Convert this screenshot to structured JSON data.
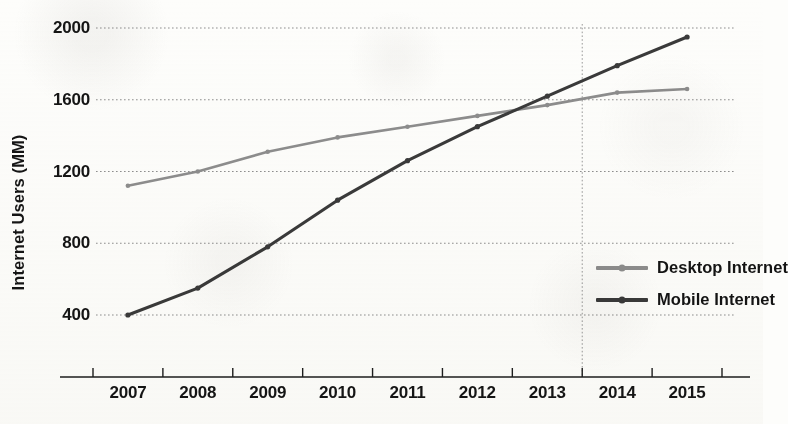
{
  "chart_data": {
    "type": "line",
    "title": "",
    "xlabel": "",
    "ylabel": "Internet Users (MM)",
    "categories": [
      "2007",
      "2008",
      "2009",
      "2010",
      "2011",
      "2012",
      "2013",
      "2014",
      "2015"
    ],
    "x": [
      2007,
      2008,
      2009,
      2010,
      2011,
      2012,
      2013,
      2014,
      2015
    ],
    "series": [
      {
        "name": "Desktop Internet",
        "color": "#8d8d8d",
        "values": [
          1120,
          1200,
          1310,
          1390,
          1450,
          1510,
          1570,
          1640,
          1660
        ]
      },
      {
        "name": "Mobile Internet",
        "color": "#3a3a3a",
        "values": [
          400,
          550,
          780,
          1040,
          1260,
          1450,
          1620,
          1790,
          1950
        ]
      }
    ],
    "ylim": [
      200,
      2100
    ],
    "yticks": [
      400,
      800,
      1200,
      1600,
      2000
    ],
    "ytick_labels": [
      "400",
      "800",
      "1200",
      "1600",
      "2000"
    ],
    "xlim": [
      2006.5,
      2015.5
    ],
    "grid": "horizontal-dotted",
    "legend_position": "center-right",
    "annotations": [
      {
        "type": "vertical-reference-line",
        "name": "crossover-line",
        "x": 2013.5,
        "style": "dotted",
        "color": "#9a9a9a",
        "note": "Mobile overtakes Desktop"
      }
    ]
  },
  "axis": {
    "y_title": "Internet Users (MM)"
  },
  "legend": {
    "items": [
      {
        "label": "Desktop Internet",
        "color": "#8d8d8d"
      },
      {
        "label": "Mobile Internet",
        "color": "#3a3a3a"
      }
    ]
  }
}
